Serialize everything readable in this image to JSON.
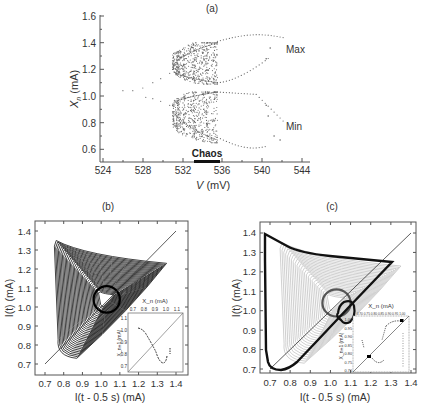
{
  "chart_data": [
    {
      "panel": "(a)",
      "type": "scatter",
      "title": "(a)",
      "xlabel": "V (mV)",
      "ylabel": "X_n (mA)",
      "xlim": [
        523.5,
        545
      ],
      "ylim": [
        0.5,
        1.6
      ],
      "xticks": [
        524,
        528,
        532,
        536,
        540,
        544
      ],
      "yticks": [
        0.6,
        0.8,
        1.0,
        1.2,
        1.4,
        1.6
      ],
      "annotations": [
        {
          "text": "Max",
          "x": 541.5,
          "y": 1.36
        },
        {
          "text": "Min",
          "x": 541.5,
          "y": 0.78
        },
        {
          "text": "Chaos",
          "x_range": [
            532.8,
            535.4
          ],
          "y": 0.5
        }
      ],
      "series": [
        {
          "name": "Max",
          "description": "bifurcation diagram of maxima: period-1 at ~1.04 (526-528), splits into branches ~1.17/0.97 (530), chaotic band 1.1-1.4 over 531-535.5, then period-2 branches 1.1->1.46 and 1.4->1.2 up to 542"
        },
        {
          "name": "Min",
          "description": "bifurcation diagram of minima: chaotic band 0.65-1.03 over 531-535.5, then branches 1.03->0.85 and 0.7->0.6 up to 542"
        }
      ],
      "grid": false
    },
    {
      "panel": "(b)",
      "type": "line",
      "title": "(b)",
      "xlabel": "I(t - 0.5 s) (mA)",
      "ylabel": "I(t) (mA)",
      "xlim": [
        0.65,
        1.45
      ],
      "ylim": [
        0.65,
        1.45
      ],
      "xticks": [
        0.7,
        0.8,
        0.9,
        1.0,
        1.1,
        1.2,
        1.3,
        1.4
      ],
      "yticks": [
        0.7,
        0.8,
        0.9,
        1.0,
        1.1,
        1.2,
        1.3,
        1.4
      ],
      "description": "chaotic attractor: dense nested triangular orbits with vertices near (0.76,1.35), (1.35,1.23), (0.82,0.73) spiraling to center (1.03,1.04); diagonal line y=x",
      "inset": {
        "xlabel": "X_n (mA)",
        "ylabel": "X_{n+1} (mA)",
        "xticks": [
          0.7,
          0.8,
          0.9,
          1.0,
          1.1
        ],
        "yticks": [
          0.7,
          0.8,
          0.9,
          1.0,
          1.1
        ],
        "description": "return map: unimodal curve falling from ~1.01 at 0.75 to ~0.75 at 1.02, then rising; diagonal y=x"
      }
    },
    {
      "panel": "(c)",
      "type": "line",
      "title": "(c)",
      "xlabel": "I(t - 0.5 s) (mA)",
      "ylabel": "I(t) (mA)",
      "xlim": [
        0.65,
        1.45
      ],
      "ylim": [
        0.65,
        1.45
      ],
      "xticks": [
        0.7,
        0.8,
        0.9,
        1.0,
        1.1,
        1.2,
        1.3,
        1.4
      ],
      "yticks": [
        0.7,
        0.8,
        0.9,
        1.0,
        1.1,
        1.2,
        1.3,
        1.4
      ],
      "description": "controlled state: gray chaotic background with bold black period-2 orbit (large triangle vertices ~(0.76,1.33),(1.34,1.21),(0.8,0.74) and small loop near (1.02,1.04)); diagonal y=x",
      "inset": {
        "xlabel": "X_n (mA)",
        "ylabel": "X_{n+1} (mA)",
        "xticks": [
          0.7,
          0.75,
          0.8,
          0.85,
          0.9,
          0.95,
          1.0
        ],
        "yticks": [
          0.7,
          0.75,
          0.8,
          0.85,
          0.9,
          0.95,
          1.0
        ],
        "description": "return map with two bold points near (0.75,0.76) and (0.98,0.98) on diagonal"
      }
    }
  ],
  "labels": {
    "a_title": "(a)",
    "b_title": "(b)",
    "c_title": "(c)",
    "a_xlabel_v": "V",
    "a_xlabel_unit": " (mV)",
    "a_ylabel_x": "X",
    "a_ylabel_sub": "n",
    "a_ylabel_unit": " (mA)",
    "max": "Max",
    "min": "Min",
    "chaos": "Chaos",
    "a_xticks": [
      "524",
      "528",
      "532",
      "536",
      "540",
      "544"
    ],
    "a_yticks": [
      "1.6",
      "1.4",
      "1.2",
      "1.0",
      "0.8",
      "0.6"
    ],
    "bc_ticks": [
      "0.7",
      "0.8",
      "0.9",
      "1.0",
      "1.1",
      "1.2",
      "1.3",
      "1.4"
    ],
    "bc_xlabel": "I(t - 0.5 s) (mA)",
    "bc_ylabel": "I(t) (mA)",
    "inset_xlabel": "X_n (mA)",
    "inset_ylabel": "X_n+1 (mA)",
    "b_inset_ticks": [
      "0.7",
      "0.8",
      "0.9",
      "1.0",
      "1.1"
    ],
    "b_inset_yticks": [
      "1.1",
      "1.0",
      "0.9",
      "0.8",
      "0.7"
    ],
    "c_inset_xticks": "0.70 0.75 0.80 0.85 0.90 0.95 1.00",
    "c_inset_yticks": [
      "1.00",
      "0.95",
      "0.90",
      "0.85",
      "0.80",
      "0.75",
      "0.70"
    ]
  }
}
